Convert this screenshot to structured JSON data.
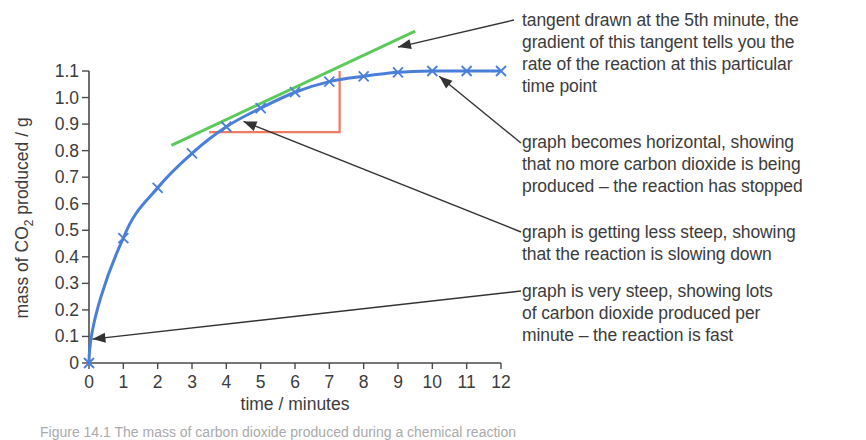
{
  "chart_data": {
    "type": "line",
    "title": "",
    "xlabel": "time / minutes",
    "ylabel": "mass of CO2 produced / g",
    "ylabel_parts": {
      "pre": "mass of CO",
      "sub": "2",
      "post": " produced / g"
    },
    "xlim": [
      0,
      12
    ],
    "ylim": [
      0,
      1.1
    ],
    "x_ticks": [
      "0",
      "1",
      "2",
      "3",
      "4",
      "5",
      "6",
      "7",
      "8",
      "9",
      "10",
      "11",
      "12"
    ],
    "y_ticks": [
      "0",
      "0.1",
      "0.2",
      "0.3",
      "0.4",
      "0.5",
      "0.6",
      "0.7",
      "0.8",
      "0.9",
      "1.0",
      "1.1"
    ],
    "grid": false,
    "series": [
      {
        "name": "mass of CO2 produced",
        "color": "#4a7fd9",
        "marker": "x",
        "x": [
          0,
          1,
          2,
          3,
          4,
          5,
          6,
          7,
          8,
          9,
          10,
          11,
          12
        ],
        "values": [
          0,
          0.47,
          0.66,
          0.79,
          0.89,
          0.96,
          1.02,
          1.06,
          1.08,
          1.095,
          1.1,
          1.1,
          1.1
        ]
      }
    ],
    "tangent": {
      "label": "tangent at 5th minute",
      "color": "#5cc95c",
      "from": [
        2.4,
        0.82
      ],
      "to": [
        9.5,
        1.25
      ]
    },
    "gradient_triangle": {
      "color": "#f07a60",
      "x_from": 3.5,
      "x_to": 7.3,
      "y_from": 0.87,
      "y_to": 1.1
    },
    "annotations": [
      {
        "id": "tangent",
        "text": "tangent drawn at the 5th minute, the\ngradient of this tangent tells you the\nrate of the reaction at this particular\ntime point",
        "points_to": [
          9.0,
          1.19
        ]
      },
      {
        "id": "horizontal",
        "text": "graph becomes horizontal, showing\nthat no more carbon dioxide is being\nproduced – the reaction has stopped",
        "points_to": [
          10.2,
          1.08
        ]
      },
      {
        "id": "less-steep",
        "text": "graph is getting less steep, showing\nthat the reaction is slowing down",
        "points_to": [
          4.5,
          0.91
        ]
      },
      {
        "id": "very-steep",
        "text": "graph is very steep, showing lots\nof carbon dioxide produced per\nminute – the reaction is fast",
        "points_to": [
          0.1,
          0.09
        ]
      }
    ]
  },
  "caption": "Figure 14.1 The mass of carbon dioxide produced during a chemical reaction"
}
